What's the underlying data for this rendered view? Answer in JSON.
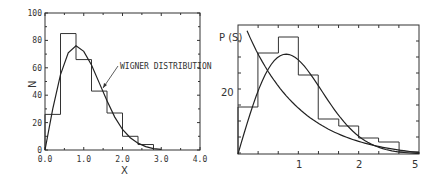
{
  "chart_data": [
    {
      "type": "bar",
      "subtype": "histogram_with_curve",
      "title": "",
      "xlabel": "X",
      "ylabel": "N",
      "xlim": [
        0,
        4.0
      ],
      "ylim": [
        0,
        100
      ],
      "xticks": [
        "0.0",
        "1.0",
        "2.0",
        "3.0",
        "4.0"
      ],
      "yticks": [
        "0",
        "20",
        "40",
        "60",
        "80",
        "100"
      ],
      "bin_edges": [
        0.0,
        0.4,
        0.8,
        1.2,
        1.6,
        2.0,
        2.4,
        2.8
      ],
      "values": [
        26,
        85,
        66,
        43,
        27,
        10,
        4
      ],
      "curve": {
        "name": "Wigner distribution",
        "x": [
          0,
          0.2,
          0.4,
          0.6,
          0.8,
          1.0,
          1.2,
          1.4,
          1.6,
          1.8,
          2.0,
          2.2,
          2.4,
          2.6,
          2.8,
          3.0
        ],
        "y": [
          0,
          30,
          55,
          71,
          76,
          72,
          62,
          49,
          36,
          24,
          15,
          9,
          5,
          2.5,
          1,
          0.5
        ]
      },
      "annotation": "WIGNER DISTRIBUTION",
      "grid": false
    },
    {
      "type": "bar",
      "subtype": "histogram_with_curves",
      "title": "",
      "xlabel": "",
      "ylabel": "P (S)",
      "xlim": [
        0,
        3
      ],
      "xticks": [
        "1",
        "2",
        "5"
      ],
      "yticks": [
        "20"
      ],
      "bin_edges": [
        0,
        0.33,
        0.67,
        1.0,
        1.33,
        1.67,
        2.0,
        2.33,
        2.67,
        3.0
      ],
      "values_px_height": [
        47,
        101,
        117,
        79,
        35,
        28,
        16,
        12,
        2
      ],
      "curves": [
        {
          "name": "Wigner-like curve",
          "shape": "rises from 0, peaks near S=0.8, decays to ~0 by S=3"
        },
        {
          "name": "Exponential (Poisson) curve",
          "shape": "monotonic decay from top-left to ~10% at S=3"
        }
      ],
      "grid": false
    }
  ],
  "left": {
    "ylabel": "N",
    "xlabel": "X",
    "annotation": "WIGNER DISTRIBUTION",
    "xticks": [
      "0.0",
      "1.0",
      "2.0",
      "3.0",
      "4.0"
    ],
    "yticks": [
      "0",
      "20",
      "40",
      "60",
      "80",
      "100"
    ]
  },
  "right": {
    "ylabel": "P (S)",
    "ytick": "20",
    "xticks": [
      "1",
      "2",
      "5"
    ]
  }
}
